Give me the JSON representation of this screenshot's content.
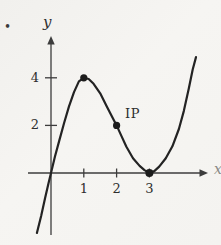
{
  "figure": {
    "bullet": "•",
    "background": "#f4f3f0",
    "curve_color": "#232323",
    "axis_color": "#3c3c3c",
    "point_color": "#1c1c1c",
    "label_color": "#2e2e2e"
  },
  "labels": {
    "y_axis": "y",
    "x_axis_partial": "x",
    "inflection": "IP"
  },
  "chart_data": {
    "type": "line",
    "title": "",
    "xlabel": "x",
    "ylabel": "y",
    "x_ticks": [
      1,
      2,
      3
    ],
    "y_ticks": [
      2,
      4
    ],
    "xlim": [
      -0.7,
      4.8
    ],
    "ylim": [
      -2.8,
      5.4
    ],
    "grid": false,
    "legend": "none",
    "key_points": [
      {
        "x": 1,
        "y": 4,
        "label": "local maximum dot"
      },
      {
        "x": 2,
        "y": 2,
        "label": "IP (inflection point) dot"
      },
      {
        "x": 3,
        "y": 0,
        "label": "local minimum dot on x-axis"
      }
    ],
    "curve_samples": [
      [
        -0.43,
        -2.52
      ],
      [
        -0.3,
        -1.8
      ],
      [
        -0.18,
        -1.05
      ],
      [
        -0.08,
        -0.45
      ],
      [
        0,
        0
      ],
      [
        0.12,
        0.68
      ],
      [
        0.25,
        1.35
      ],
      [
        0.4,
        2.1
      ],
      [
        0.55,
        2.8
      ],
      [
        0.7,
        3.4
      ],
      [
        0.85,
        3.85
      ],
      [
        1.0,
        4.0
      ],
      [
        1.15,
        3.95
      ],
      [
        1.3,
        3.75
      ],
      [
        1.5,
        3.35
      ],
      [
        1.7,
        2.8
      ],
      [
        1.85,
        2.4
      ],
      [
        2.0,
        2.0
      ],
      [
        2.15,
        1.55
      ],
      [
        2.3,
        1.1
      ],
      [
        2.5,
        0.62
      ],
      [
        2.7,
        0.3
      ],
      [
        2.85,
        0.12
      ],
      [
        3.0,
        0.0
      ],
      [
        3.15,
        0.08
      ],
      [
        3.3,
        0.27
      ],
      [
        3.5,
        0.62
      ],
      [
        3.7,
        1.12
      ],
      [
        3.9,
        1.85
      ],
      [
        4.05,
        2.6
      ],
      [
        4.2,
        3.55
      ],
      [
        4.32,
        4.35
      ],
      [
        4.42,
        4.87
      ]
    ]
  }
}
